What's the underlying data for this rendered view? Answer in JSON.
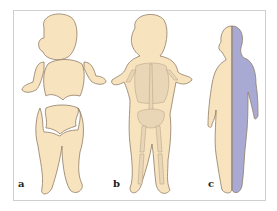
{
  "figure": {
    "panels": [
      {
        "label": "a",
        "description": "Body outline divided into head, thorax, arms, abdomen/pelvis and legs"
      },
      {
        "label": "b",
        "description": "Body outline with skeleton overlay"
      },
      {
        "label": "c",
        "description": "Side/front figure, half skin-colored and half blue-shaded"
      }
    ]
  },
  "colors": {
    "skin": "#f8e3bf",
    "outline": "#8f7c66",
    "blue": "#a8aad4",
    "bone": "#e9d6b7",
    "frame": "#cfcfcf"
  }
}
